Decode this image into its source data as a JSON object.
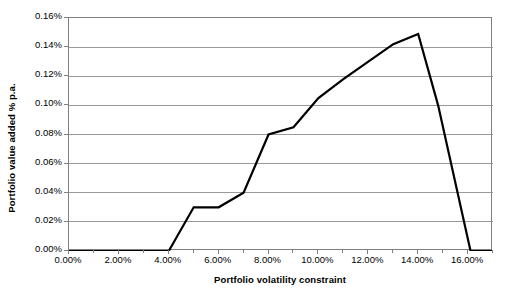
{
  "chart_data": {
    "type": "line",
    "title": "",
    "xlabel": "Portfolio volatility constraint",
    "ylabel": "Portfolio value added % p.a.",
    "xlim": [
      0.0,
      17.0
    ],
    "ylim": [
      0.0,
      0.16
    ],
    "grid": "horizontal",
    "legend": "none",
    "x_tick_labels": [
      "0.00%",
      "2.00%",
      "4.00%",
      "6.00%",
      "8.00%",
      "10.00%",
      "12.00%",
      "14.00%",
      "16.00%"
    ],
    "x_tick_values": [
      0,
      2,
      4,
      6,
      8,
      10,
      12,
      14,
      16
    ],
    "x_minor_tick_values": [
      1,
      3,
      5,
      7,
      9,
      11,
      13,
      15,
      17
    ],
    "y_tick_labels": [
      "0.00%",
      "0.02%",
      "0.04%",
      "0.06%",
      "0.08%",
      "0.10%",
      "0.12%",
      "0.14%",
      "0.16%"
    ],
    "y_tick_values": [
      0.0,
      0.02,
      0.04,
      0.06,
      0.08,
      0.1,
      0.12,
      0.14,
      0.16
    ],
    "series": [
      {
        "name": "Portfolio value added",
        "color": "#000000",
        "x": [
          0.0,
          1.0,
          2.0,
          3.0,
          4.0,
          5.0,
          6.0,
          7.0,
          8.0,
          9.0,
          10.0,
          11.0,
          12.0,
          13.0,
          14.0,
          14.8,
          16.1,
          17.0
        ],
        "y": [
          0.0,
          0.0,
          0.0,
          0.0,
          0.0,
          0.03,
          0.03,
          0.04,
          0.08,
          0.085,
          0.105,
          0.118,
          0.13,
          0.142,
          0.149,
          0.1,
          0.0,
          0.0
        ]
      }
    ]
  },
  "axes": {
    "x_title": "Portfolio volatility constraint",
    "y_title": "Portfolio value added % p.a."
  },
  "colors": {
    "line": "#000000",
    "gridline": "#9a9a9a",
    "axis": "#808080",
    "background": "#ffffff",
    "text": "#000000"
  }
}
